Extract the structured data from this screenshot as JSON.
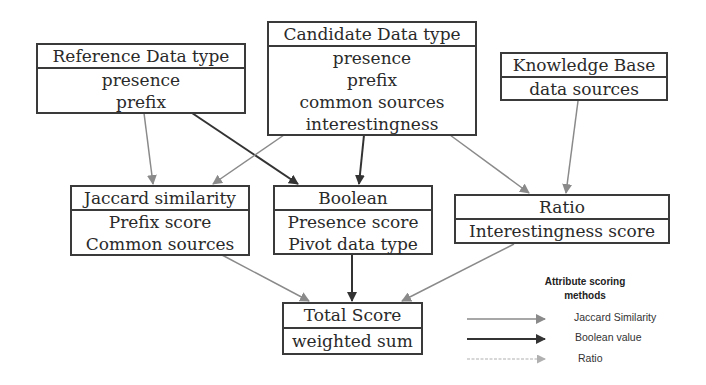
{
  "diagram": {
    "nodes": {
      "reference": {
        "title": "Reference Data type",
        "items": [
          "presence",
          "prefix"
        ]
      },
      "candidate": {
        "title": "Candidate Data type",
        "items": [
          "presence",
          "prefix",
          "common sources",
          "interestingness"
        ]
      },
      "knowledge": {
        "title": "Knowledge Base",
        "items": [
          "data sources"
        ]
      },
      "jaccard": {
        "title": "Jaccard similarity",
        "items": [
          "Prefix score",
          "Common sources"
        ]
      },
      "boolean": {
        "title": "Boolean",
        "items": [
          "Presence score",
          "Pivot data type"
        ]
      },
      "ratio": {
        "title": "Ratio",
        "items": [
          "Interestingness score"
        ]
      },
      "total": {
        "title": "Total Score",
        "items": [
          "weighted sum"
        ]
      }
    },
    "edges": [
      {
        "from": "Reference Data type",
        "to": "Jaccard similarity",
        "style": "jaccard"
      },
      {
        "from": "Reference Data type",
        "to": "Boolean",
        "style": "boolean"
      },
      {
        "from": "Candidate Data type",
        "to": "Jaccard similarity",
        "style": "jaccard"
      },
      {
        "from": "Candidate Data type",
        "to": "Boolean",
        "style": "boolean"
      },
      {
        "from": "Candidate Data type",
        "to": "Ratio",
        "style": "jaccard"
      },
      {
        "from": "Knowledge Base",
        "to": "Ratio",
        "style": "jaccard"
      },
      {
        "from": "Jaccard similarity",
        "to": "Total Score",
        "style": "jaccard"
      },
      {
        "from": "Boolean",
        "to": "Total Score",
        "style": "boolean"
      },
      {
        "from": "Ratio",
        "to": "Total Score",
        "style": "jaccard"
      }
    ],
    "colors": {
      "jaccard_edge": "#8a8a8a",
      "boolean_edge": "#333333",
      "ratio_edge": "#b0b0b0",
      "box_border": "#3a3a3a"
    }
  },
  "legend": {
    "title_line1": "Attribute scoring",
    "title_line2": "methods",
    "items": [
      {
        "label": "Jaccard Similarity",
        "style": "jaccard"
      },
      {
        "label": "Boolean value",
        "style": "boolean"
      },
      {
        "label": "Ratio",
        "style": "ratio"
      }
    ]
  }
}
